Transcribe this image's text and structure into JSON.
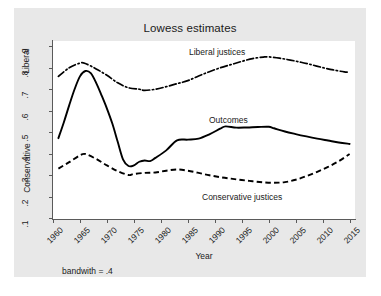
{
  "chart_data": {
    "type": "line",
    "title": "Lowess estimates",
    "xlabel": "Year",
    "ylabel_top": "Liberal",
    "ylabel_bottom": "Conservative",
    "note": "bandwith = .4",
    "xlim": [
      1960,
      2016
    ],
    "ylim": [
      0.095,
      0.925
    ],
    "grid": false,
    "legend_position": "inline-annotations",
    "xticks": [
      1960,
      1965,
      1970,
      1975,
      1980,
      1985,
      1990,
      1995,
      2000,
      2005,
      2010,
      2015
    ],
    "xtick_labels": [
      "1960",
      "1965",
      "1970",
      "1975",
      "1980",
      "1985",
      "1990",
      "1995",
      "2000",
      "2005",
      "2010",
      "2015"
    ],
    "yticks": [
      0.1,
      0.2,
      0.3,
      0.4,
      0.5,
      0.6,
      0.7,
      0.8,
      0.9
    ],
    "ytick_labels": [
      ".1",
      ".2",
      ".3",
      ".4",
      ".5",
      ".6",
      ".7",
      ".8",
      ".9"
    ],
    "series": [
      {
        "name": "Liberal justices",
        "style": "dashdot",
        "color": "#000000",
        "x": [
          1961,
          1963,
          1965,
          1966,
          1968,
          1970,
          1972,
          1974,
          1976,
          1977,
          1979,
          1981,
          1983,
          1985,
          1987,
          1989,
          1991,
          1993,
          1995,
          1997,
          1999,
          2000,
          2002,
          2004,
          2006,
          2008,
          2010,
          2012,
          2014,
          2015
        ],
        "values": [
          0.76,
          0.8,
          0.822,
          0.82,
          0.795,
          0.765,
          0.73,
          0.707,
          0.7,
          0.695,
          0.7,
          0.712,
          0.726,
          0.74,
          0.762,
          0.782,
          0.8,
          0.815,
          0.83,
          0.843,
          0.85,
          0.851,
          0.845,
          0.836,
          0.826,
          0.814,
          0.801,
          0.79,
          0.781,
          0.779
        ]
      },
      {
        "name": "Outcomes",
        "style": "solid",
        "color": "#000000",
        "x": [
          1961,
          1962,
          1963,
          1964,
          1965,
          1966,
          1967,
          1968,
          1969,
          1970,
          1971,
          1972,
          1973,
          1974,
          1975,
          1976,
          1977,
          1978,
          1979,
          1981,
          1983,
          1985,
          1987,
          1989,
          1991,
          1992,
          1994,
          1996,
          1998,
          2000,
          2001,
          2003,
          2005,
          2007,
          2009,
          2011,
          2013,
          2015
        ],
        "values": [
          0.472,
          0.545,
          0.625,
          0.7,
          0.76,
          0.785,
          0.775,
          0.73,
          0.672,
          0.61,
          0.54,
          0.455,
          0.372,
          0.342,
          0.345,
          0.362,
          0.368,
          0.365,
          0.38,
          0.415,
          0.462,
          0.465,
          0.47,
          0.49,
          0.516,
          0.527,
          0.521,
          0.522,
          0.524,
          0.525,
          0.518,
          0.503,
          0.491,
          0.48,
          0.47,
          0.461,
          0.452,
          0.445
        ]
      },
      {
        "name": "Conservative justices",
        "style": "dashed",
        "color": "#000000",
        "x": [
          1961,
          1963,
          1965,
          1966,
          1968,
          1970,
          1972,
          1974,
          1975,
          1977,
          1979,
          1981,
          1983,
          1985,
          1987,
          1989,
          1991,
          1993,
          1995,
          1997,
          1999,
          2001,
          2003,
          2005,
          2007,
          2009,
          2011,
          2013,
          2015
        ],
        "values": [
          0.33,
          0.36,
          0.392,
          0.398,
          0.375,
          0.345,
          0.318,
          0.3,
          0.305,
          0.31,
          0.312,
          0.32,
          0.326,
          0.32,
          0.31,
          0.299,
          0.29,
          0.283,
          0.277,
          0.271,
          0.266,
          0.264,
          0.267,
          0.278,
          0.295,
          0.315,
          0.338,
          0.365,
          0.398
        ]
      }
    ],
    "annotations": [
      {
        "text": "Liberal justices",
        "x": 1988,
        "y": 0.885
      },
      {
        "text": "Outcomes",
        "x": 1991,
        "y": 0.575
      },
      {
        "text": "Conservative justices",
        "x": 1991,
        "y": 0.225
      }
    ]
  },
  "colors": {
    "figure_background": "#e8e8e8",
    "plot_background": "#ffffff",
    "axis": "#5a5a5a",
    "text": "#1a1a1a",
    "line": "#000000"
  }
}
